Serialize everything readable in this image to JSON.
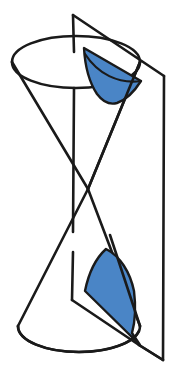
{
  "figure": {
    "title": "Double cone intersected by a vertical plane",
    "background_color": "#ffffff",
    "stroke_color": "#1a1a1a",
    "shade_color": "#4a85c6",
    "shade_edge_color": "#1a1a1a",
    "canvas": {
      "width": 176,
      "height": 378
    }
  },
  "parts": {
    "upper_nappe": {
      "name": "upper-cone-nappe",
      "base_ellipse": {
        "cx": 76,
        "cy": 62,
        "rx": 64,
        "ry": 26
      }
    },
    "lower_nappe": {
      "name": "lower-cone-nappe",
      "base_ellipse": {
        "cx": 79,
        "cy": 326,
        "rx": 61,
        "ry": 26
      }
    },
    "apex": {
      "x": 88,
      "y": 189
    },
    "cutting_plane": {
      "name": "cutting-plane",
      "corners": [
        {
          "x": 73,
          "y": 15
        },
        {
          "x": 164,
          "y": 76
        },
        {
          "x": 163,
          "y": 360
        },
        {
          "x": 72,
          "y": 300
        }
      ]
    },
    "upper_section": {
      "name": "upper-hyperbolic-section",
      "label": "upper branch",
      "fill": "#4a85c6"
    },
    "lower_section": {
      "name": "lower-hyperbolic-section",
      "label": "lower branch",
      "fill": "#4a85c6"
    }
  },
  "paths": {
    "plane_outline": "M 73 15 L 164 76 L 163 360 L 72 300",
    "plane_left_edge_upper": "M 73 15 L 74 50",
    "plane_left_edge_lower": "M 72 232 L 72 300",
    "plane_right_edge": "M 164 76 L 163 360",
    "plane_top_edge": "M 73 15 L 164 76",
    "plane_bottom_edge": "M 72 300 L 163 360",
    "upper_ellipse_back": "M 12 62 A 64 26 0 0 1 140 62",
    "upper_ellipse_front": "M 12 62 A 64 26 0 0 0 140 62",
    "lower_ellipse_front": "M 18 326 A 61 26 0 0 0 140 326",
    "lower_ellipse_back": "M 18 326 A 61 26 0 0 1 140 326",
    "cone_left_upper": "M 12 62 L 88 189",
    "cone_right_upper": "M 140 62 L 88 189",
    "cone_left_lower": "M 88 189 L 18 326",
    "cone_right_lower": "M 88 189 L 140 326",
    "upper_shade": "M 84 50 C 86 74 94 92 106 102 C 118 104 130 96 140 82 L 84 50 Z",
    "lower_shade": "M 105 249 C 122 256 133 278 134 302 C 126 318 118 332 140 345 L 85 291 Z"
  }
}
